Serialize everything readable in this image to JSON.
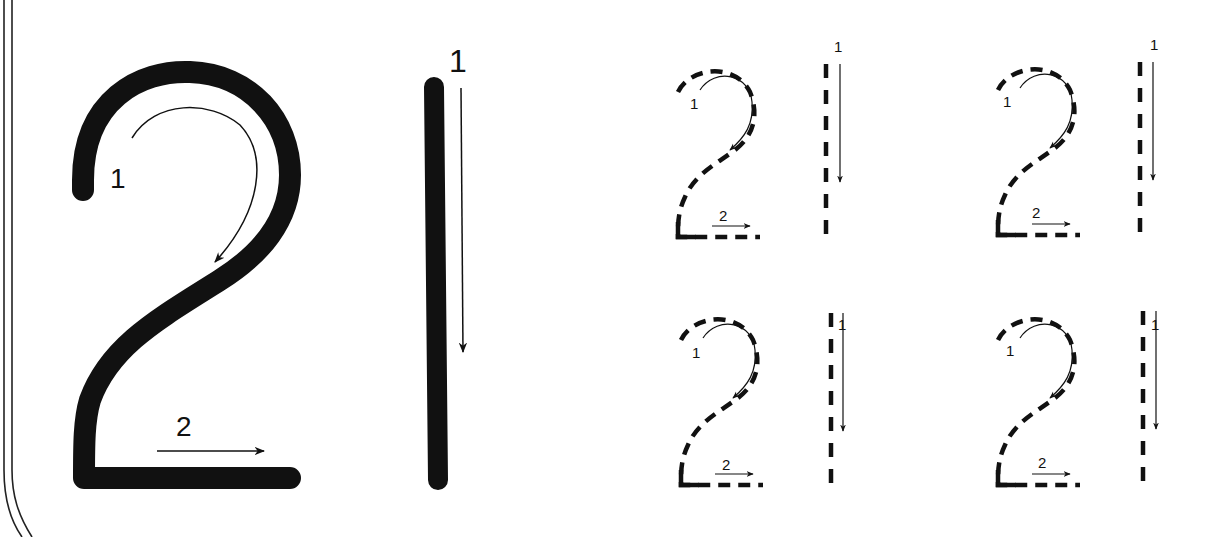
{
  "worksheet": {
    "number": "21",
    "colors": {
      "ink": "#111111",
      "paper": "#ffffff",
      "border": "#222222"
    },
    "model": {
      "digit_two": {
        "stroke_labels": [
          "1",
          "2"
        ]
      },
      "digit_one": {
        "stroke_labels": [
          "1"
        ]
      }
    },
    "practice": [
      {
        "digit_two": {
          "stroke_labels": [
            "1",
            "2"
          ]
        },
        "digit_one": {
          "stroke_labels": [
            "1"
          ]
        }
      },
      {
        "digit_two": {
          "stroke_labels": [
            "1",
            "2"
          ]
        },
        "digit_one": {
          "stroke_labels": [
            "1"
          ]
        }
      },
      {
        "digit_two": {
          "stroke_labels": [
            "1",
            "2"
          ]
        },
        "digit_one": {
          "stroke_labels": [
            "1"
          ]
        }
      },
      {
        "digit_two": {
          "stroke_labels": [
            "1",
            "2"
          ]
        },
        "digit_one": {
          "stroke_labels": [
            "1"
          ]
        }
      }
    ],
    "icons": [
      "stroke-arrow-icon",
      "curved-stroke-arrow-icon"
    ]
  }
}
